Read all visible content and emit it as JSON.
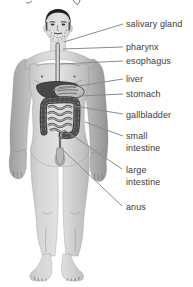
{
  "diagram": {
    "type": "human-digestive-system-anatomy",
    "labels": [
      {
        "id": "salivary-gland",
        "text": "salivary gland"
      },
      {
        "id": "pharynx",
        "text": "pharynx"
      },
      {
        "id": "esophagus",
        "text": "esophagus"
      },
      {
        "id": "liver",
        "text": "liver"
      },
      {
        "id": "stomach",
        "text": "stomach"
      },
      {
        "id": "gallbladder",
        "text": "gallbladder"
      },
      {
        "id": "small-intestine",
        "text": "small\nintestine"
      },
      {
        "id": "large-intestine",
        "text": "large\nintestine"
      },
      {
        "id": "anus",
        "text": "anus"
      }
    ],
    "colors": {
      "background": "#ffffff",
      "label_text": "#3b3b3b",
      "leader_line": "#8b8b8b",
      "body_light": "#dedede",
      "body_dark": "#8e8e8e",
      "hair": "#1e1e1e",
      "liver_fill": "#474747",
      "intestine_outline": "#3e3e3e"
    }
  }
}
